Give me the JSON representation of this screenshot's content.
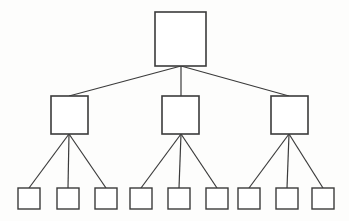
{
  "diagram": {
    "type": "hierarchical-tree",
    "title": "",
    "canvas": {
      "width": 349,
      "height": 221,
      "background": "#fdfdfc"
    },
    "style": {
      "node_fill": "#ffffff",
      "node_stroke": "#3b3b3b",
      "node_stroke_width": 1.6,
      "leaf_stroke_width": 1.4,
      "edge_stroke": "#3b3b3b",
      "edge_stroke_width": 1.2
    },
    "levels": [
      {
        "name": "root",
        "count": 1
      },
      {
        "name": "branch",
        "count": 3
      },
      {
        "name": "leaf",
        "count": 9
      }
    ],
    "nodes": [
      {
        "id": "root",
        "level": 0,
        "label": "",
        "x": 155,
        "y": 12,
        "w": 51,
        "h": 54
      },
      {
        "id": "b1",
        "level": 1,
        "label": "",
        "x": 51,
        "y": 96,
        "w": 37,
        "h": 38
      },
      {
        "id": "b2",
        "level": 1,
        "label": "",
        "x": 162,
        "y": 96,
        "w": 37,
        "h": 38
      },
      {
        "id": "b3",
        "level": 1,
        "label": "",
        "x": 271,
        "y": 96,
        "w": 37,
        "h": 38
      },
      {
        "id": "l1",
        "level": 2,
        "label": "",
        "x": 18,
        "y": 188,
        "w": 22,
        "h": 21
      },
      {
        "id": "l2",
        "level": 2,
        "label": "",
        "x": 57,
        "y": 188,
        "w": 22,
        "h": 21
      },
      {
        "id": "l3",
        "level": 2,
        "label": "",
        "x": 95,
        "y": 188,
        "w": 22,
        "h": 21
      },
      {
        "id": "l4",
        "level": 2,
        "label": "",
        "x": 130,
        "y": 188,
        "w": 22,
        "h": 21
      },
      {
        "id": "l5",
        "level": 2,
        "label": "",
        "x": 168,
        "y": 188,
        "w": 22,
        "h": 21
      },
      {
        "id": "l6",
        "level": 2,
        "label": "",
        "x": 206,
        "y": 188,
        "w": 22,
        "h": 21
      },
      {
        "id": "l7",
        "level": 2,
        "label": "",
        "x": 238,
        "y": 188,
        "w": 22,
        "h": 21
      },
      {
        "id": "l8",
        "level": 2,
        "label": "",
        "x": 276,
        "y": 188,
        "w": 22,
        "h": 21
      },
      {
        "id": "l9",
        "level": 2,
        "label": "",
        "x": 312,
        "y": 188,
        "w": 22,
        "h": 21
      }
    ],
    "edges": [
      {
        "id": "e-root-b1",
        "from": "root",
        "to": "b1",
        "x1": 181,
        "y1": 66,
        "x2": 69,
        "y2": 96
      },
      {
        "id": "e-root-b2",
        "from": "root",
        "to": "b2",
        "x1": 181,
        "y1": 66,
        "x2": 181,
        "y2": 96
      },
      {
        "id": "e-root-b3",
        "from": "root",
        "to": "b3",
        "x1": 181,
        "y1": 66,
        "x2": 289,
        "y2": 96
      },
      {
        "id": "e-b1-l1",
        "from": "b1",
        "to": "l1",
        "x1": 69,
        "y1": 134,
        "x2": 29,
        "y2": 188
      },
      {
        "id": "e-b1-l2",
        "from": "b1",
        "to": "l2",
        "x1": 69,
        "y1": 134,
        "x2": 68,
        "y2": 188
      },
      {
        "id": "e-b1-l3",
        "from": "b1",
        "to": "l3",
        "x1": 69,
        "y1": 134,
        "x2": 106,
        "y2": 188
      },
      {
        "id": "e-b2-l4",
        "from": "b2",
        "to": "l4",
        "x1": 181,
        "y1": 134,
        "x2": 141,
        "y2": 188
      },
      {
        "id": "e-b2-l5",
        "from": "b2",
        "to": "l5",
        "x1": 181,
        "y1": 134,
        "x2": 179,
        "y2": 188
      },
      {
        "id": "e-b2-l6",
        "from": "b2",
        "to": "l6",
        "x1": 181,
        "y1": 134,
        "x2": 217,
        "y2": 188
      },
      {
        "id": "e-b3-l7",
        "from": "b3",
        "to": "l7",
        "x1": 289,
        "y1": 134,
        "x2": 249,
        "y2": 188
      },
      {
        "id": "e-b3-l8",
        "from": "b3",
        "to": "l8",
        "x1": 289,
        "y1": 134,
        "x2": 287,
        "y2": 188
      },
      {
        "id": "e-b3-l9",
        "from": "b3",
        "to": "l9",
        "x1": 289,
        "y1": 134,
        "x2": 323,
        "y2": 188
      }
    ]
  }
}
